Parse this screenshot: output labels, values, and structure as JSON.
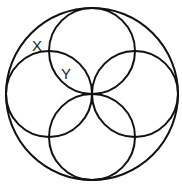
{
  "diagram": {
    "type": "circle-geometry",
    "stroke_color": "#111111",
    "background": "#ffffff",
    "outer_circle": {
      "cx": 92,
      "cy": 94,
      "r": 86
    },
    "inner_circles": [
      {
        "name": "top",
        "cx": 92,
        "cy": 51,
        "r": 43
      },
      {
        "name": "right",
        "cx": 135,
        "cy": 94,
        "r": 43
      },
      {
        "name": "bottom",
        "cx": 92,
        "cy": 137,
        "r": 43
      },
      {
        "name": "left",
        "cx": 49,
        "cy": 94,
        "r": 43
      }
    ],
    "labels": [
      {
        "text": "X",
        "x": 32,
        "y": 51
      },
      {
        "text": "Y",
        "x": 61,
        "y": 79
      }
    ]
  }
}
